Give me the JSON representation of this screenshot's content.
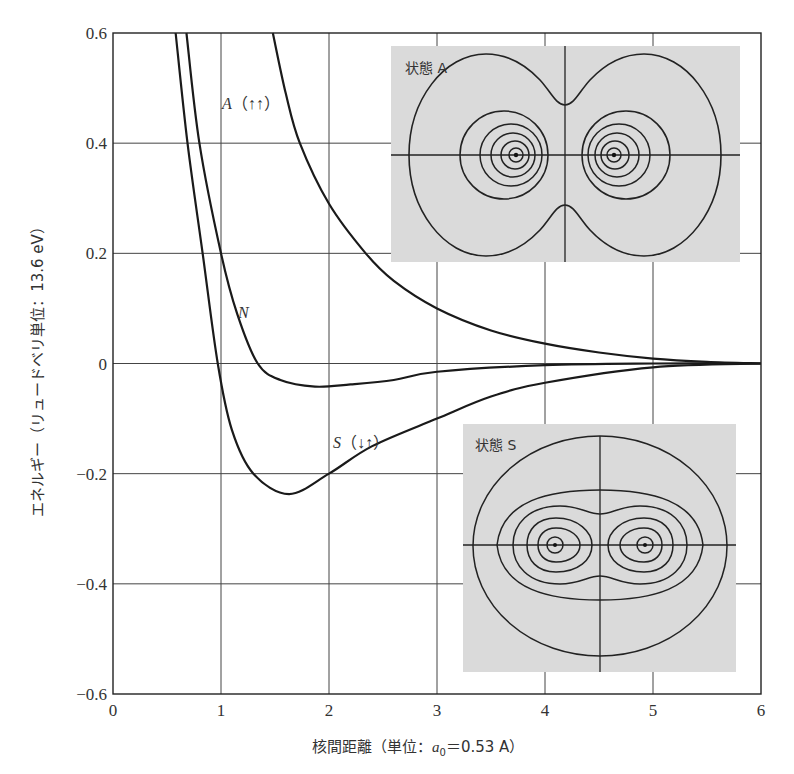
{
  "chart_data": {
    "type": "line",
    "title": "",
    "xlabel": "核間距離（単位：a₀＝0.53 A）",
    "xlabel_parts": {
      "prefix": "核間距離（単位：",
      "var": "a",
      "sub": "0",
      "suffix": "＝0.53 A）"
    },
    "ylabel": "エネルギー（リュードベリ単位：13.6 eV）",
    "xlim": [
      0,
      6
    ],
    "ylim": [
      -0.6,
      0.6
    ],
    "x_ticks": [
      0,
      1,
      2,
      3,
      4,
      5,
      6
    ],
    "y_ticks": [
      0.6,
      0.4,
      0.2,
      0,
      -0.2,
      -0.4,
      -0.6
    ],
    "y_tick_labels": [
      "0.6",
      "0.4",
      "0.2",
      "0",
      "−0.2",
      "−0.4",
      "−0.6"
    ],
    "grid": true,
    "series": [
      {
        "name": "A(↑↑)",
        "label": "A（↑↑）",
        "points": [
          [
            1.48,
            0.6
          ],
          [
            1.6,
            0.49
          ],
          [
            1.73,
            0.4
          ],
          [
            2.0,
            0.29
          ],
          [
            2.34,
            0.2
          ],
          [
            2.6,
            0.15
          ],
          [
            3.0,
            0.1
          ],
          [
            3.5,
            0.06
          ],
          [
            4.0,
            0.036
          ],
          [
            4.5,
            0.02
          ],
          [
            5.0,
            0.009
          ],
          [
            5.5,
            0.003
          ],
          [
            6.0,
            0.0
          ]
        ]
      },
      {
        "name": "N",
        "label": "N",
        "points": [
          [
            0.68,
            0.6
          ],
          [
            0.8,
            0.4
          ],
          [
            1.0,
            0.2
          ],
          [
            1.15,
            0.09
          ],
          [
            1.34,
            0.0
          ],
          [
            1.55,
            -0.03
          ],
          [
            1.87,
            -0.042
          ],
          [
            2.2,
            -0.038
          ],
          [
            2.6,
            -0.03
          ],
          [
            3.0,
            -0.015
          ],
          [
            4.0,
            -0.003
          ],
          [
            5.0,
            0.0
          ],
          [
            6.0,
            0.0
          ]
        ]
      },
      {
        "name": "S(↓↑)",
        "label": "S（↓↑）",
        "points": [
          [
            0.58,
            0.6
          ],
          [
            0.69,
            0.4
          ],
          [
            0.83,
            0.2
          ],
          [
            0.97,
            0.0
          ],
          [
            1.1,
            -0.12
          ],
          [
            1.3,
            -0.2
          ],
          [
            1.63,
            -0.237
          ],
          [
            2.0,
            -0.2
          ],
          [
            2.4,
            -0.15
          ],
          [
            3.0,
            -0.1
          ],
          [
            3.5,
            -0.06
          ],
          [
            4.0,
            -0.035
          ],
          [
            5.0,
            -0.007
          ],
          [
            6.0,
            0.0
          ]
        ]
      }
    ],
    "annotations": [
      {
        "text": "A（↑↑）",
        "x": 1.0,
        "y": 0.47,
        "series": "A(↑↑)"
      },
      {
        "text": "N",
        "x": 1.17,
        "y": 0.09,
        "series": "N"
      },
      {
        "text": "S（↓↑）",
        "x": 2.03,
        "y": -0.15,
        "series": "S(↓↑)"
      }
    ],
    "insets": [
      {
        "title": "状態 A",
        "description": "Contour plot of electron density for antisymmetric state A: two separate lobes centered on nuclei with a node at midplane"
      },
      {
        "title": "状態 S",
        "description": "Contour plot of electron density for symmetric state S: contours enclose both nuclei with density between them"
      }
    ]
  },
  "colors": {
    "background": "#ffffff",
    "grid": "#444444",
    "curve": "#1a1a1a",
    "inset_fill": "#dadada",
    "text": "#333333"
  }
}
